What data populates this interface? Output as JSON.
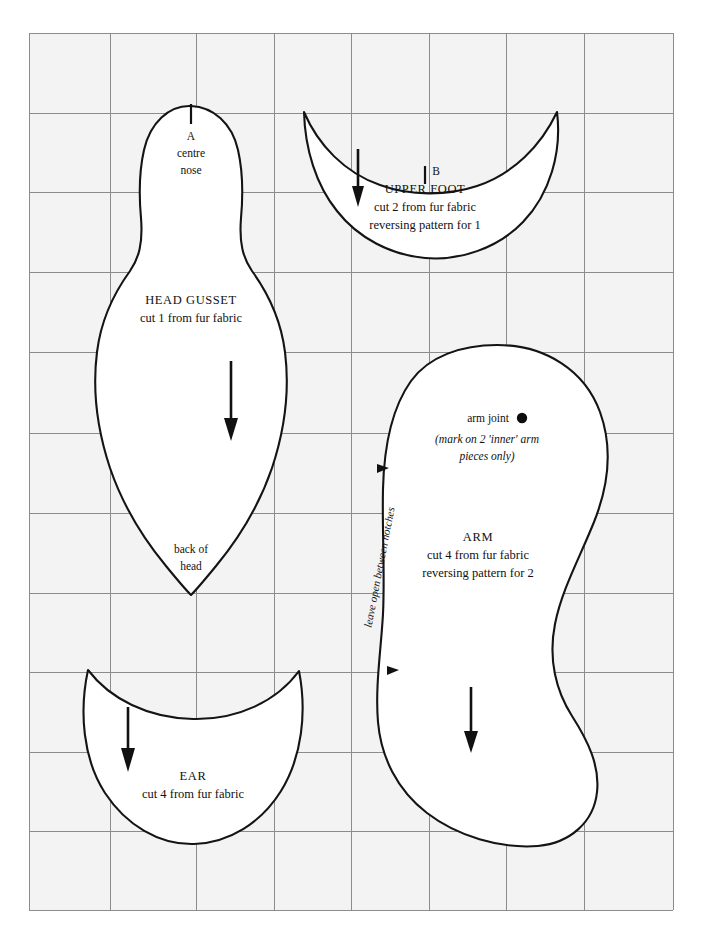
{
  "sheet": {
    "title": "Teddy Bear Sewing Pattern Sheet",
    "background_color": "#ffffff",
    "grid_fill": "#f3f3f3",
    "grid_line_color": "#8c8c8c",
    "ink_color": "#141414",
    "grid": {
      "columns": 8,
      "rows": 11,
      "x_positions": [
        29,
        110,
        196,
        274,
        351,
        429,
        506,
        584,
        673
      ],
      "y_positions": [
        33,
        113,
        192,
        272,
        352,
        433,
        513,
        593,
        672,
        752,
        831,
        910
      ]
    }
  },
  "pieces": {
    "head_gusset": {
      "name": "head-gusset",
      "title": "HEAD GUSSET",
      "cut_instruction": "cut 1 from fur fabric",
      "top_mark_letter": "A",
      "top_mark_label_line1": "centre",
      "top_mark_label_line2": "nose",
      "bottom_label_line1": "back of",
      "bottom_label_line2": "head",
      "grain_arrow": "grain-arrow-down"
    },
    "upper_foot": {
      "name": "upper-foot",
      "title": "UPPER FOOT",
      "cut_instruction_line1": "cut 2 from fur fabric",
      "cut_instruction_line2": "reversing pattern for 1",
      "mark_letter": "B",
      "grain_arrow": "grain-arrow-down"
    },
    "arm": {
      "name": "arm",
      "title": "ARM",
      "cut_instruction_line1": "cut 4 from fur fabric",
      "cut_instruction_line2": "reversing pattern for 2",
      "joint_label": "arm joint",
      "joint_note_line1": "(mark on 2 'inner' arm",
      "joint_note_line2": "pieces only)",
      "seam_note": "leave open between notches",
      "grain_arrow": "grain-arrow-down",
      "notches": 2
    },
    "ear": {
      "name": "ear",
      "title": "EAR",
      "cut_instruction": "cut 4 from fur fabric",
      "grain_arrow": "grain-arrow-down"
    }
  }
}
